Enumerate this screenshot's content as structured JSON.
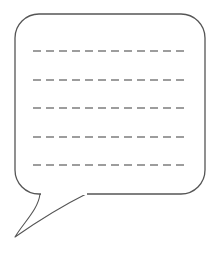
{
  "canvas": {
    "width": 218,
    "height": 255,
    "background_color": "#ffffff"
  },
  "illustration": {
    "name": "speech-bubble-with-blank-lines",
    "description": "Outlined rounded speech balloon with a pointed tail at lower left and five horizontal dashed writing lines inside",
    "alt_text": "Empty speech bubble containing five dashed placeholder text lines"
  },
  "bubble": {
    "shape": "rounded-rectangle",
    "stroke_color": "#555555",
    "fill_color": "#ffffff",
    "stroke_width": 1.3,
    "x": 15,
    "y": 14,
    "width": 190,
    "height": 180,
    "corner_radius": 24
  },
  "tail": {
    "shape": "curved-pointed-tail",
    "direction": "lower-left",
    "stroke_color": "#555555",
    "fill_color": "#ffffff",
    "stroke_width": 1.1,
    "tip_x": 15,
    "tip_y": 237,
    "base_start_x": 40,
    "base_start_y": 194,
    "base_end_x": 88,
    "base_end_y": 193
  },
  "dashed_lines": {
    "count": 5,
    "stroke_color": "#7d7d7d",
    "stroke_width": 1.6,
    "dash_length": 8,
    "gap_length": 5,
    "x_start": 33,
    "x_end": 188,
    "y_positions": [
      51,
      80,
      108,
      137,
      165
    ],
    "labels": [
      "line-1",
      "line-2",
      "line-3",
      "line-4",
      "line-5"
    ]
  }
}
